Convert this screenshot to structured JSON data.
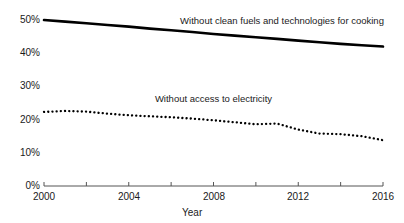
{
  "chart_data": {
    "type": "line",
    "title": "",
    "xlabel": "Year",
    "ylabel": "",
    "xlim": [
      2000,
      2016
    ],
    "ylim": [
      0,
      50
    ],
    "grid": false,
    "legend_position": "inline-annotation",
    "x_tick_labels": [
      "2000",
      "2004",
      "2008",
      "2012",
      "2016"
    ],
    "x_tick_values": [
      2000,
      2004,
      2008,
      2012,
      2016
    ],
    "x_minor_tick_values": [
      2000,
      2002,
      2004,
      2006,
      2008,
      2010,
      2012,
      2014,
      2016
    ],
    "y_tick_labels": [
      "0%",
      "10%",
      "20%",
      "30%",
      "40%",
      "50%"
    ],
    "y_tick_values": [
      0,
      10,
      20,
      30,
      40,
      50
    ],
    "x": [
      2000,
      2001,
      2002,
      2003,
      2004,
      2005,
      2006,
      2007,
      2008,
      2009,
      2010,
      2011,
      2012,
      2013,
      2014,
      2015,
      2016
    ],
    "series": [
      {
        "name": "Without clean fuels and technologies for cooking",
        "style": "solid",
        "color": "#000000",
        "label_x": 2010.2,
        "label_y": 49.6,
        "values": [
          50.0,
          49.5,
          49.0,
          48.5,
          48.0,
          47.4,
          46.9,
          46.4,
          45.8,
          45.3,
          44.8,
          44.3,
          43.8,
          43.3,
          42.8,
          42.4,
          42.0
        ]
      },
      {
        "name": "Without access to electricity",
        "style": "dotted",
        "color": "#000000",
        "label_x": 2004.3,
        "label_y": 26.2,
        "values": [
          22.3,
          22.6,
          22.4,
          21.8,
          21.3,
          21.0,
          20.7,
          20.3,
          19.8,
          19.2,
          18.6,
          18.8,
          17.0,
          15.8,
          15.6,
          15.0,
          13.8
        ]
      }
    ]
  }
}
